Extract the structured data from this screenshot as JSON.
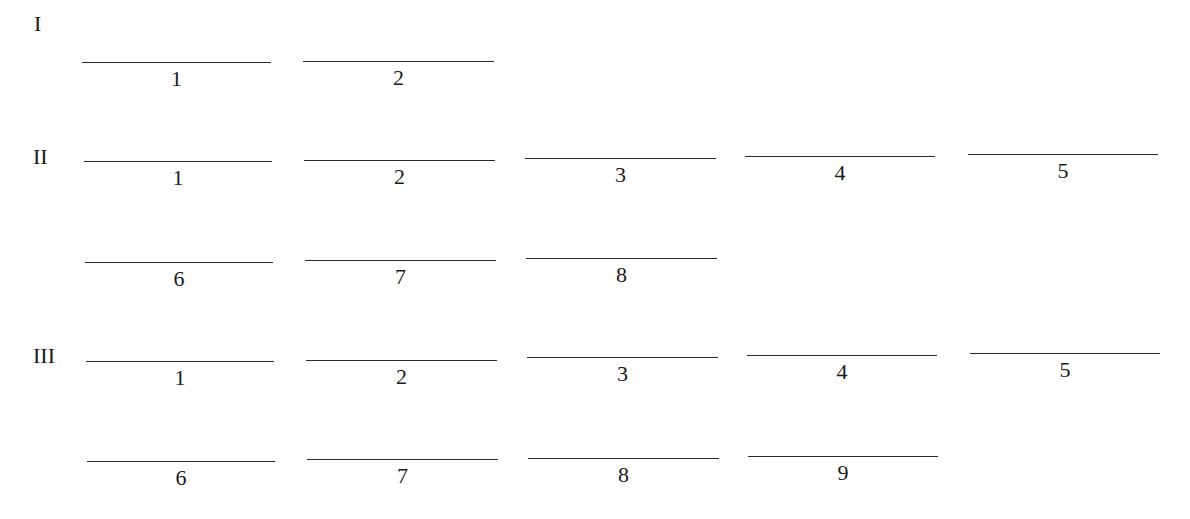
{
  "sections": [
    {
      "label": "I",
      "label_pos": {
        "x": 34,
        "y": 13
      },
      "rows": [
        {
          "blanks": [
            {
              "number": "1",
              "x": 82,
              "y": 62,
              "w": 189
            },
            {
              "number": "2",
              "x": 303,
              "y": 61,
              "w": 191
            }
          ]
        }
      ]
    },
    {
      "label": "II",
      "label_pos": {
        "x": 33,
        "y": 146
      },
      "rows": [
        {
          "blanks": [
            {
              "number": "1",
              "x": 84,
              "y": 161,
              "w": 188
            },
            {
              "number": "2",
              "x": 304,
              "y": 160,
              "w": 191
            },
            {
              "number": "3",
              "x": 525,
              "y": 158,
              "w": 191
            },
            {
              "number": "4",
              "x": 745,
              "y": 156,
              "w": 190
            },
            {
              "number": "5",
              "x": 968,
              "y": 154,
              "w": 190
            }
          ]
        },
        {
          "blanks": [
            {
              "number": "6",
              "x": 85,
              "y": 262,
              "w": 188
            },
            {
              "number": "7",
              "x": 305,
              "y": 260,
              "w": 191
            },
            {
              "number": "8",
              "x": 526,
              "y": 258,
              "w": 191
            }
          ]
        }
      ]
    },
    {
      "label": "III",
      "label_pos": {
        "x": 33,
        "y": 345
      },
      "rows": [
        {
          "blanks": [
            {
              "number": "1",
              "x": 86,
              "y": 361,
              "w": 188
            },
            {
              "number": "2",
              "x": 306,
              "y": 360,
              "w": 191
            },
            {
              "number": "3",
              "x": 527,
              "y": 357,
              "w": 191
            },
            {
              "number": "4",
              "x": 747,
              "y": 355,
              "w": 190
            },
            {
              "number": "5",
              "x": 970,
              "y": 353,
              "w": 190
            }
          ]
        },
        {
          "blanks": [
            {
              "number": "6",
              "x": 87,
              "y": 461,
              "w": 188
            },
            {
              "number": "7",
              "x": 307,
              "y": 459,
              "w": 191
            },
            {
              "number": "8",
              "x": 528,
              "y": 458,
              "w": 191
            },
            {
              "number": "9",
              "x": 748,
              "y": 456,
              "w": 190
            }
          ]
        }
      ]
    }
  ]
}
